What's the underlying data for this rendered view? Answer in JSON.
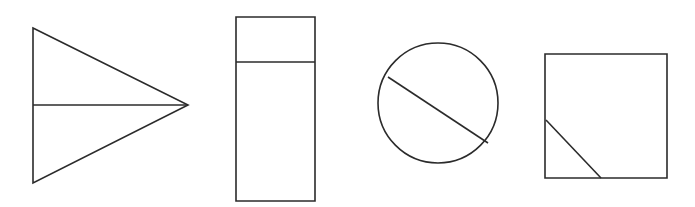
{
  "figure": {
    "background_color": "#ffffff",
    "stroke_color": "#2b2b2b",
    "stroke_width": 1.6,
    "canvas_width": 695,
    "canvas_height": 207,
    "shape_count": 4
  },
  "shapes": [
    {
      "index": 1,
      "name": "triangle",
      "label": "Right-pointing triangle bisected by a horizontal line",
      "outline_type": "polygon",
      "points": "33,28 188,105 33,183",
      "divider_type": "line",
      "divider_label": "horizontal bisector from left edge to apex",
      "divider_x1": 33,
      "divider_y1": 105,
      "divider_x2": 188,
      "divider_y2": 105,
      "bbox": {
        "x": 33,
        "y": 28,
        "width": 155,
        "height": 155
      }
    },
    {
      "index": 2,
      "name": "rectangle",
      "label": "Tall vertical rectangle divided by a horizontal line near the top",
      "outline_type": "rect",
      "x": 236,
      "y": 17,
      "width": 79,
      "height": 184,
      "divider_type": "line",
      "divider_label": "horizontal divider separating top band",
      "divider_x1": 236,
      "divider_y1": 62,
      "divider_x2": 315,
      "divider_y2": 62,
      "bbox": {
        "x": 236,
        "y": 17,
        "width": 79,
        "height": 184
      }
    },
    {
      "index": 3,
      "name": "circle",
      "label": "Circle crossed by a diagonal chord",
      "outline_type": "circle",
      "cx": 438,
      "cy": 103,
      "r": 60,
      "divider_type": "line",
      "divider_label": "diagonal chord from upper-left to lower-right",
      "divider_x1": 388,
      "divider_y1": 77,
      "divider_x2": 488,
      "divider_y2": 143,
      "bbox": {
        "x": 378,
        "y": 43,
        "width": 120,
        "height": 120
      }
    },
    {
      "index": 4,
      "name": "square",
      "label": "Square with a short diagonal cutting the lower-left corner",
      "outline_type": "rect",
      "x": 545,
      "y": 54,
      "width": 122,
      "height": 124,
      "divider_type": "line",
      "divider_label": "diagonal from left edge to bottom edge",
      "divider_x1": 546,
      "divider_y1": 120,
      "divider_x2": 601,
      "divider_y2": 178,
      "bbox": {
        "x": 545,
        "y": 54,
        "width": 122,
        "height": 124
      }
    }
  ]
}
